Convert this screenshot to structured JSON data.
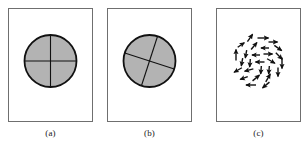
{
  "figure": {
    "background_color": "#ffffff",
    "frame_color": "#6f6f6f",
    "ink_color": "#111111",
    "disk_fill_color": "#b3b3b3",
    "disk_stroke_color": "#111111"
  },
  "panels": [
    {
      "id": "a",
      "caption": "(a)",
      "kind": "disk-with-cross",
      "description": "Gray filled circle crossed by a vertical and a horizontal diameter",
      "disk": {
        "cx": 42.5,
        "cy": 53,
        "r": 26
      },
      "diameters": [
        {
          "name": "vertical-diameter",
          "angle_deg": 90
        },
        {
          "name": "horizontal-diameter",
          "angle_deg": 0
        }
      ]
    },
    {
      "id": "b",
      "caption": "(b)",
      "kind": "disk-with-rotated-cross",
      "description": "Gray filled circle crossed by two perpendicular diameters rotated about 18 degrees",
      "disk": {
        "cx": 42.5,
        "cy": 53,
        "r": 26
      },
      "rotation_deg": 18,
      "diameters": [
        {
          "name": "rotated-vertical-diameter",
          "angle_deg": 72
        },
        {
          "name": "rotated-horizontal-diameter",
          "angle_deg": -18
        }
      ]
    },
    {
      "id": "c",
      "caption": "(c)",
      "kind": "random-arrow-field",
      "description": "Cluster of small arrows with randomly distributed orientations filling a circular region",
      "cluster": {
        "cx": 42.5,
        "cy": 53,
        "r": 26
      },
      "arrow_count": 27,
      "arrows": [
        {
          "x": 34,
          "y": 30,
          "angle_deg": -55,
          "len": 9
        },
        {
          "x": 47,
          "y": 30,
          "angle_deg": 0,
          "len": 11
        },
        {
          "x": 57,
          "y": 34,
          "angle_deg": 0,
          "len": 9
        },
        {
          "x": 25,
          "y": 37,
          "angle_deg": -35,
          "len": 8
        },
        {
          "x": 38,
          "y": 38,
          "angle_deg": -50,
          "len": 9
        },
        {
          "x": 49,
          "y": 40,
          "angle_deg": 180,
          "len": 8
        },
        {
          "x": 62,
          "y": 40,
          "angle_deg": 35,
          "len": 9
        },
        {
          "x": 20,
          "y": 47,
          "angle_deg": -90,
          "len": 11
        },
        {
          "x": 30,
          "y": 46,
          "angle_deg": 100,
          "len": 8
        },
        {
          "x": 40,
          "y": 47,
          "angle_deg": 180,
          "len": 8
        },
        {
          "x": 52,
          "y": 46,
          "angle_deg": 0,
          "len": 9
        },
        {
          "x": 63,
          "y": 48,
          "angle_deg": 45,
          "len": 9
        },
        {
          "x": 26,
          "y": 54,
          "angle_deg": 100,
          "len": 8
        },
        {
          "x": 34,
          "y": 55,
          "angle_deg": 95,
          "len": 8
        },
        {
          "x": 44,
          "y": 54,
          "angle_deg": 180,
          "len": 9
        },
        {
          "x": 55,
          "y": 53,
          "angle_deg": 30,
          "len": 9
        },
        {
          "x": 66,
          "y": 55,
          "angle_deg": 90,
          "len": 11
        },
        {
          "x": 22,
          "y": 62,
          "angle_deg": 150,
          "len": 9
        },
        {
          "x": 33,
          "y": 62,
          "angle_deg": 165,
          "len": 9
        },
        {
          "x": 45,
          "y": 62,
          "angle_deg": 95,
          "len": 8
        },
        {
          "x": 53,
          "y": 62,
          "angle_deg": 95,
          "len": 8
        },
        {
          "x": 62,
          "y": 64,
          "angle_deg": 90,
          "len": 9
        },
        {
          "x": 28,
          "y": 70,
          "angle_deg": 160,
          "len": 8
        },
        {
          "x": 40,
          "y": 70,
          "angle_deg": -40,
          "len": 9
        },
        {
          "x": 52,
          "y": 70,
          "angle_deg": -60,
          "len": 9
        },
        {
          "x": 35,
          "y": 77,
          "angle_deg": 180,
          "len": 10
        },
        {
          "x": 50,
          "y": 77,
          "angle_deg": 140,
          "len": 9
        }
      ]
    }
  ]
}
